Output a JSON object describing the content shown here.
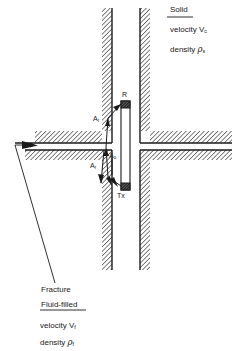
{
  "diagram": {
    "type": "borehole-fracture-schematic",
    "colors": {
      "ink": "#1a1a1a",
      "background": "#ffffff"
    }
  },
  "solid": {
    "heading": "Solid",
    "velocity_label": "velocity",
    "velocity_symbol": "V",
    "velocity_subscript": "c",
    "density_label": "density",
    "density_symbol": "ρ",
    "density_subscript": "s"
  },
  "fracture": {
    "title": "Fracture",
    "heading": "Fluid-filled",
    "velocity_label": "velocity",
    "velocity_symbol": "V",
    "velocity_subscript": "f",
    "density_label": "density",
    "density_symbol": "ρ",
    "density_subscript": "f"
  },
  "tool": {
    "receiver_label": "R",
    "transmitter_label": "Tx"
  },
  "waves": {
    "transmitted": {
      "symbol": "A",
      "subscript": "t"
    },
    "incident": {
      "symbol": "A",
      "subscript": "o"
    },
    "reflected": {
      "symbol": "A",
      "subscript": "r"
    }
  }
}
